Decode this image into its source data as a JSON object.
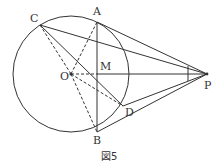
{
  "figure": {
    "caption": "図5",
    "circle": {
      "center": "O",
      "cx": 71,
      "cy": 74,
      "r": 58
    },
    "points": {
      "A": {
        "label": "A",
        "x": 97,
        "y": 22
      },
      "B": {
        "label": "B",
        "x": 97,
        "y": 132
      },
      "C": {
        "label": "C",
        "x": 40,
        "y": 25
      },
      "D": {
        "label": "D",
        "x": 123,
        "y": 106
      },
      "M": {
        "label": "M",
        "x": 97,
        "y": 74
      },
      "O": {
        "label": "O",
        "x": 71,
        "y": 74
      },
      "P": {
        "label": "P",
        "x": 207,
        "y": 74
      }
    },
    "solid_segments": [
      "AB",
      "PA",
      "PB",
      "PC",
      "PD",
      "PM",
      "CD"
    ],
    "dashed_segments": [
      "OC",
      "OA",
      "OB",
      "OM",
      "OD"
    ]
  }
}
